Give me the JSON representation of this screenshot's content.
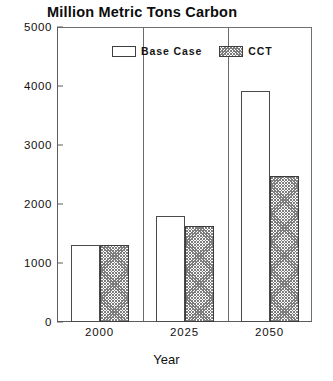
{
  "chart_data": {
    "type": "bar",
    "title": "Million Metric Tons Carbon",
    "xlabel": "Year",
    "ylabel": "",
    "categories": [
      "2000",
      "2025",
      "2050"
    ],
    "series": [
      {
        "name": "Base Case",
        "values": [
          1300,
          1800,
          3920
        ],
        "fill": "solid-white",
        "color": "#ffffff"
      },
      {
        "name": "CCT",
        "values": [
          1300,
          1620,
          2470
        ],
        "fill": "cross-hatch",
        "color": "#7d7d7d"
      }
    ],
    "ylim": [
      0,
      5000
    ],
    "yticks": [
      0,
      1000,
      2000,
      3000,
      4000,
      5000
    ],
    "ytick_labels": [
      "0",
      "1000",
      "2000",
      "3000",
      "4000",
      "5000"
    ],
    "xtick_labels": [
      "2000",
      "2025",
      "2050"
    ],
    "grid": false,
    "legend_position": "inside-top-center",
    "frame": true,
    "axis_color": "#5c5c5c"
  },
  "legend": {
    "items": [
      {
        "label": "Base Case"
      },
      {
        "label": "CCT"
      }
    ]
  }
}
